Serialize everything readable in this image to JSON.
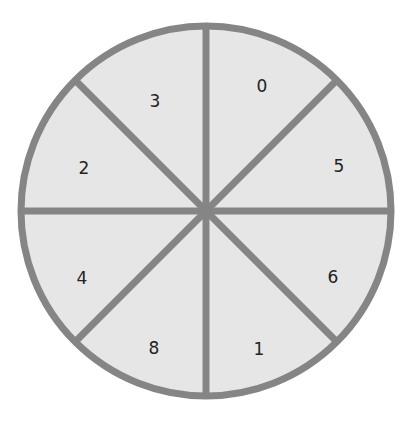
{
  "spinner": {
    "center": [
      206,
      211
    ],
    "radius": 185,
    "colors": {
      "fill": "#e6e6e6",
      "stroke": "#858585",
      "text": "#222222"
    },
    "sectors": [
      {
        "label": "0",
        "position": "top-right-upper",
        "x": 262,
        "y": 86
      },
      {
        "label": "5",
        "position": "right-upper",
        "x": 339,
        "y": 166
      },
      {
        "label": "6",
        "position": "right-lower",
        "x": 333,
        "y": 277
      },
      {
        "label": "1",
        "position": "bottom-right-lower",
        "x": 259,
        "y": 349
      },
      {
        "label": "8",
        "position": "bottom-left-lower",
        "x": 154,
        "y": 348
      },
      {
        "label": "4",
        "position": "left-lower",
        "x": 82,
        "y": 278
      },
      {
        "label": "2",
        "position": "left-upper",
        "x": 84,
        "y": 168
      },
      {
        "label": "3",
        "position": "top-left-upper",
        "x": 155,
        "y": 101
      }
    ]
  }
}
